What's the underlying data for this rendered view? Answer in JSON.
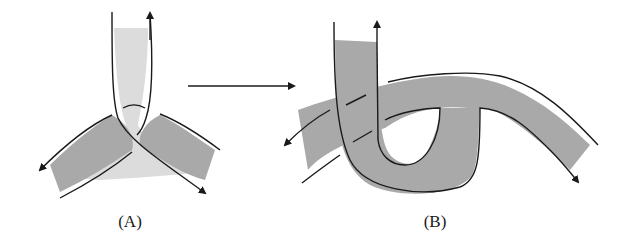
{
  "figure": {
    "panels": [
      {
        "id": "A",
        "label": "(A)",
        "description": "Three ribbon bands meeting at a trivalent junction; vertical light band crossing two darker diagonal bands"
      },
      {
        "id": "B",
        "label": "(B)",
        "description": "Deformed ribbon: vertical band bent into a U-loop passing over a long curved band with dashed under-crossings"
      }
    ],
    "transition_arrow": {
      "from": "A",
      "to": "B",
      "direction": "right"
    },
    "colors": {
      "light_band": "#dcdcdc",
      "dark_band": "#a9a9a9",
      "stroke": "#1a1a1a",
      "background": "#ffffff"
    }
  }
}
